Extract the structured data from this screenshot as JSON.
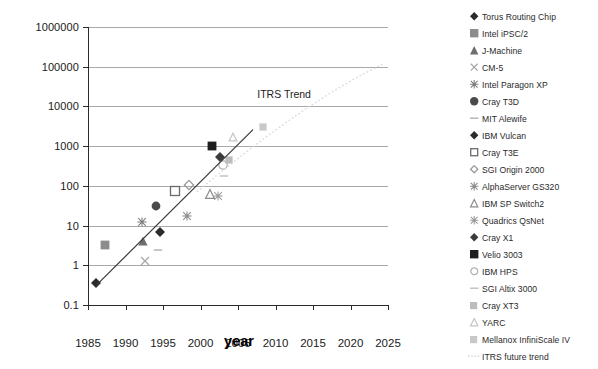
{
  "chart_data": {
    "type": "scatter",
    "title": "",
    "xlabel": "year",
    "ylabel": "bandwidth per router node (Gb/s)",
    "xlim": [
      1985,
      2025
    ],
    "ylim": [
      0.1,
      1000000
    ],
    "yscale": "log",
    "grid": "horizontal",
    "legend_position": "right",
    "xticks": [
      "1985",
      "1990",
      "1995",
      "2000",
      "2005",
      "2010",
      "2015",
      "2020",
      "2025"
    ],
    "yticks": [
      "1000000",
      "100000",
      "10000",
      "1000",
      "100",
      "10",
      "1",
      "0.1"
    ],
    "annotations": [
      {
        "text": "ITRS Trend",
        "x": 2010.5,
        "y": 21000
      }
    ],
    "trendline": {
      "name": "trend",
      "x0": 1986.0,
      "y0": 0.3,
      "x1": 2007.0,
      "y1": 2600
    },
    "series": [
      {
        "name": "Torus Routing Chip",
        "marker": "diamond-filled",
        "color": "#2b2b2b",
        "x": 1986.0,
        "y": 0.35
      },
      {
        "name": "Intel iPSC/2",
        "marker": "square-filled",
        "color": "#8c8c8c",
        "x": 1987.2,
        "y": 3.2
      },
      {
        "name": "J-Machine",
        "marker": "triangle-filled",
        "color": "#6e6e6e",
        "x": 1992.3,
        "y": 4.0
      },
      {
        "name": "CM-5",
        "marker": "cross",
        "color": "#a8a8a8",
        "x": 1992.6,
        "y": 1.3
      },
      {
        "name": "Intel Paragon XP",
        "marker": "star",
        "color": "#7d7d7d",
        "x": 1992.2,
        "y": 12.0
      },
      {
        "name": "Cray T3D",
        "marker": "circle-filled",
        "color": "#4a4a4a",
        "x": 1994.0,
        "y": 31.0
      },
      {
        "name": "MIT Alewife",
        "marker": "dash",
        "color": "#b0b0b0",
        "x": 1994.3,
        "y": 2.4
      },
      {
        "name": "IBM Vulcan",
        "marker": "diamond-filled",
        "color": "#2b2b2b",
        "x": 1994.6,
        "y": 7.0
      },
      {
        "name": "Cray T3E",
        "marker": "square-open",
        "color": "#6b6b6b",
        "x": 1996.6,
        "y": 76.0
      },
      {
        "name": "SGI Origin 2000",
        "marker": "diamond-open",
        "color": "#9a9a9a",
        "x": 1998.4,
        "y": 105.0
      },
      {
        "name": "AlphaServer GS320",
        "marker": "star",
        "color": "#8a8a8a",
        "x": 1998.2,
        "y": 17.0
      },
      {
        "name": "IBM SP Switch2",
        "marker": "triangle-open",
        "color": "#8a8a8a",
        "x": 2001.3,
        "y": 62.0
      },
      {
        "name": "Quadrics QsNet",
        "marker": "star",
        "color": "#9a9a9a",
        "x": 2002.3,
        "y": 56.0
      },
      {
        "name": "Cray X1",
        "marker": "diamond-filled",
        "color": "#3b3b3b",
        "x": 2002.6,
        "y": 520.0
      },
      {
        "name": "Velio 3003",
        "marker": "square-filled",
        "color": "#1e1e1e",
        "x": 2001.5,
        "y": 1000.0
      },
      {
        "name": "IBM HPS",
        "marker": "circle-open",
        "color": "#b4b4b4",
        "x": 2003.0,
        "y": 340.0
      },
      {
        "name": "SGI Altix 3000",
        "marker": "dash",
        "color": "#c0c0c0",
        "x": 2003.1,
        "y": 180.0
      },
      {
        "name": "Cray XT3",
        "marker": "square-faint",
        "color": "#bdbdbd",
        "x": 2003.8,
        "y": 450.0
      },
      {
        "name": "YARC",
        "marker": "triangle-faint",
        "color": "#c4c4c4",
        "x": 2004.3,
        "y": 1700.0
      },
      {
        "name": "Mellanox InfiniScale IV",
        "marker": "square-faint",
        "color": "#c8c8c8",
        "x": 2008.3,
        "y": 3000.0
      },
      {
        "name": "ITRS future trend",
        "marker": "dotted-line",
        "color": "#d2d2d2",
        "x": null,
        "y": null
      }
    ]
  },
  "axes": {
    "ylabel": "bandwidth per router node (Gb/s)",
    "xlabel": "year"
  },
  "annotation": {
    "itrs_trend": "ITRS Trend"
  }
}
